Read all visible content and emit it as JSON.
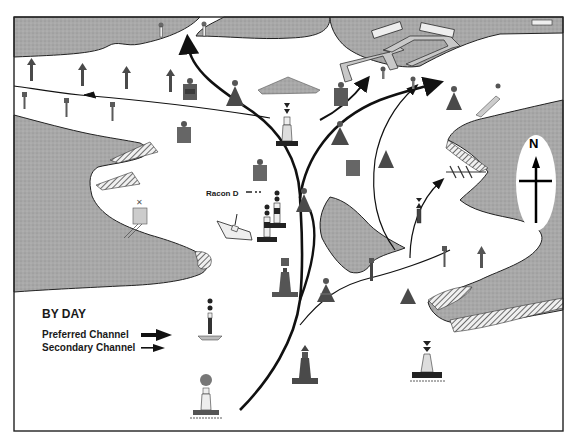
{
  "diagram": {
    "legend": {
      "heading": "BY DAY",
      "items": [
        {
          "label": "Preferred Channel",
          "arrow": "thick"
        },
        {
          "label": "Secondary Channel",
          "arrow": "thin"
        }
      ]
    },
    "annotations": {
      "racon": "Racon D",
      "north": "N"
    },
    "colors": {
      "land": "#a9a9a9",
      "water": "#ffffff",
      "mark_dark": "#4a4a4a",
      "mark_mid": "#6b6b6b",
      "line": "#111111",
      "border": "#222222"
    },
    "marks": [
      {
        "kind": "can-buoy-light",
        "region": "northwest channel"
      },
      {
        "kind": "cone-buoy-light",
        "region": "north channel"
      },
      {
        "kind": "lighthouse-black-top",
        "region": "channel junction"
      },
      {
        "kind": "wreck",
        "region": "west"
      },
      {
        "kind": "isolated-danger-light",
        "region": "wreck"
      },
      {
        "kind": "safe-water-mark",
        "region": "entrance"
      },
      {
        "kind": "isolated-danger-beacon",
        "region": "legend"
      },
      {
        "kind": "cardinal-south",
        "region": "southeast"
      },
      {
        "kind": "dolphin",
        "region": "south-central"
      }
    ]
  }
}
